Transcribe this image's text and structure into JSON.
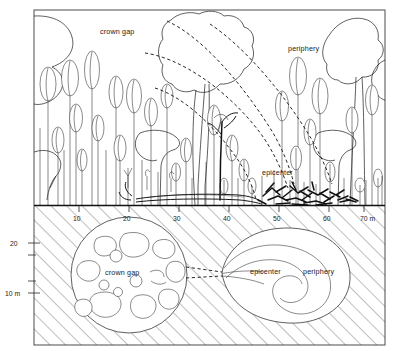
{
  "figure": {
    "title_visible": false,
    "background_color": "#ffffff",
    "ink_color": "#1b1b1b",
    "frame_color": "#5c5c5c"
  },
  "upper_panel": {
    "name": "forest-profile-cross-section",
    "labels": [
      {
        "id": "crown-gap",
        "text": "crown gap",
        "x": 125,
        "y": 32
      },
      {
        "id": "periphery",
        "text": "periphery",
        "x": 310,
        "y": 49
      },
      {
        "id": "epicenter",
        "text": "epicenter",
        "x": 284,
        "y": 173
      }
    ]
  },
  "lower_panel": {
    "name": "plan-view-below-ground",
    "labels": [
      {
        "id": "crown-gap",
        "text": "crown gap",
        "x": 134,
        "y": 272
      },
      {
        "id": "epicenter",
        "text": "epicenter",
        "x": 265,
        "y": 271
      },
      {
        "id": "periphery",
        "text": "periphery",
        "x": 322,
        "y": 271
      }
    ]
  },
  "x_axis": {
    "name": "distance-axis",
    "unit": "m",
    "ticks": [
      {
        "value": "10",
        "x": 79
      },
      {
        "value": "20",
        "x": 129
      },
      {
        "value": "30",
        "x": 179
      },
      {
        "value": "40",
        "x": 229
      },
      {
        "value": "50",
        "x": 279
      },
      {
        "value": "60",
        "x": 329
      },
      {
        "value": "70 m",
        "x": 372
      }
    ]
  },
  "y_axis": {
    "name": "height-axis",
    "unit": "m",
    "ticks": [
      {
        "value": "20",
        "y": 243
      },
      {
        "value": "10 m",
        "y": 293
      }
    ]
  },
  "colors": {
    "ink": "#1b1b1b",
    "frame": "#5c5c5c",
    "hatch": "#2d2d2d",
    "background": "#ffffff"
  }
}
